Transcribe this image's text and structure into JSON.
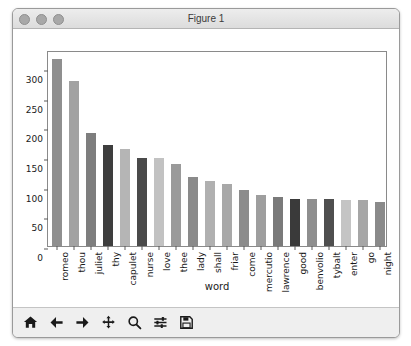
{
  "window": {
    "title": "Figure 1",
    "controls": [
      "close-button",
      "minimize-button",
      "zoom-button"
    ]
  },
  "toolbar": {
    "buttons": [
      {
        "name": "home-icon",
        "label": "Home"
      },
      {
        "name": "back-arrow-icon",
        "label": "Back"
      },
      {
        "name": "forward-arrow-icon",
        "label": "Forward"
      },
      {
        "name": "pan-move-icon",
        "label": "Pan"
      },
      {
        "name": "magnifier-zoom-icon",
        "label": "Zoom to rectangle"
      },
      {
        "name": "sliders-configure-icon",
        "label": "Configure subplots"
      },
      {
        "name": "floppy-save-icon",
        "label": "Save the figure"
      }
    ]
  },
  "chart_data": {
    "type": "bar",
    "title": "",
    "xlabel": "word",
    "ylabel": "",
    "ylim": [
      0,
      330
    ],
    "yticks": [
      0,
      50,
      100,
      150,
      200,
      250,
      300
    ],
    "grid": false,
    "legend": null,
    "categories": [
      "romeo",
      "thou",
      "juliet",
      "thy",
      "capulet",
      "nurse",
      "love",
      "thee",
      "lady",
      "shall",
      "friar",
      "come",
      "mercutio",
      "lawrence",
      "good",
      "benvolio",
      "tybalt",
      "enter",
      "go",
      "night"
    ],
    "values": [
      315,
      277,
      191,
      170,
      164,
      149,
      148,
      138,
      117,
      110,
      105,
      94,
      86,
      83,
      80,
      79,
      79,
      77,
      77,
      74
    ],
    "colors": [
      "#8f8f8f",
      "#a2a2a2",
      "#7e7e7e",
      "#3e3e3e",
      "#b5b5b5",
      "#4a4a4a",
      "#c2c2c2",
      "#9a9a9a",
      "#8a8a8a",
      "#b0b0b0",
      "#a8a8a8",
      "#8c8c8c",
      "#9e9e9e",
      "#7a7a7a",
      "#3a3a3a",
      "#8e8e8e",
      "#4f4f4f",
      "#c4c4c4",
      "#a6a6a6",
      "#8a8a8a"
    ]
  }
}
